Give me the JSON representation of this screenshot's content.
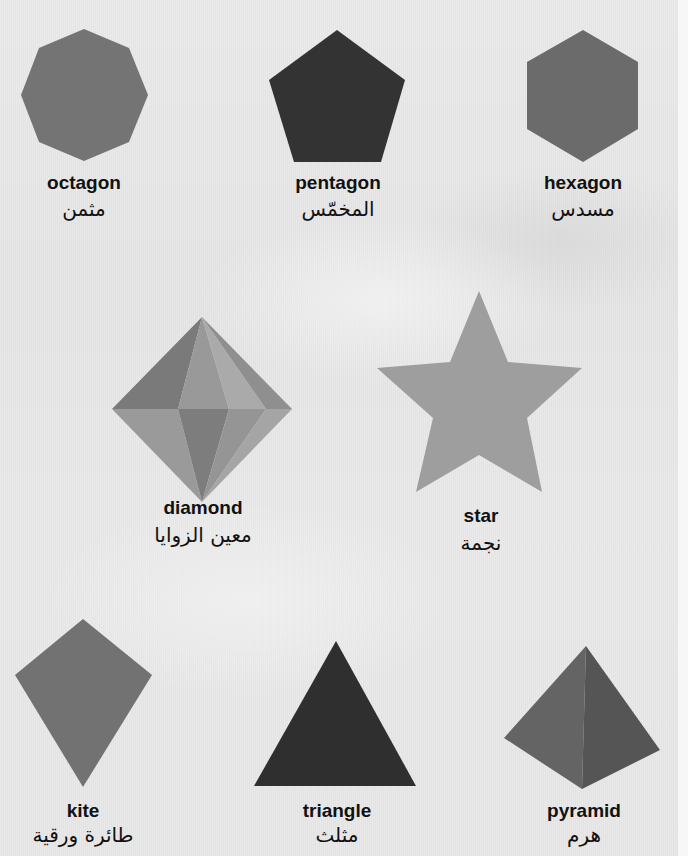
{
  "colors": {
    "octagon": "#747474",
    "pentagon": "#333333",
    "hexagon": "#6b6b6b",
    "star": "#9e9e9e",
    "kite": "#727272",
    "triangle": "#2f2f2f",
    "pyramid_left": "#646464",
    "pyramid_right": "#555555",
    "diamond_facets": [
      "#7a7a7a",
      "#999999",
      "#aaaaaa",
      "#8f8f8f",
      "#9a9a9a",
      "#7d7d7d",
      "#959595",
      "#a5a5a5"
    ]
  },
  "shapes": [
    {
      "id": "octagon",
      "english": "octagon",
      "arabic": "مثمن",
      "label_x": 84,
      "en_y": 172,
      "ar_y": 196
    },
    {
      "id": "pentagon",
      "english": "pentagon",
      "arabic": "المخمّس",
      "label_x": 338,
      "en_y": 172,
      "ar_y": 196
    },
    {
      "id": "hexagon",
      "english": "hexagon",
      "arabic": "مسدس",
      "label_x": 583,
      "en_y": 172,
      "ar_y": 196
    },
    {
      "id": "diamond",
      "english": "diamond",
      "arabic": "معين الزوايا",
      "label_x": 203,
      "en_y": 497,
      "ar_y": 522
    },
    {
      "id": "star",
      "english": "star",
      "arabic": "نجمة",
      "label_x": 481,
      "en_y": 505,
      "ar_y": 530
    },
    {
      "id": "kite",
      "english": "kite",
      "arabic": "طائرة ورقية",
      "label_x": 83,
      "en_y": 800,
      "ar_y": 822
    },
    {
      "id": "triangle",
      "english": "triangle",
      "arabic": "مثلث",
      "label_x": 337,
      "en_y": 800,
      "ar_y": 822
    },
    {
      "id": "pyramid",
      "english": "pyramid",
      "arabic": "هرم",
      "label_x": 584,
      "en_y": 800,
      "ar_y": 822
    }
  ]
}
